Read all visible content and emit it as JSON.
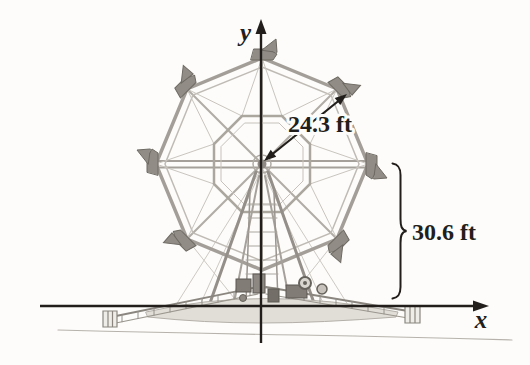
{
  "figure": {
    "axes": {
      "x_label": "x",
      "y_label": "y"
    },
    "annotations": {
      "radius_label": "24.3 ft",
      "height_label": "30.6 ft"
    },
    "values": {
      "wheel_radius_ft": 24.3,
      "hub_height_ft": 30.6
    },
    "colors": {
      "background": "#fdfcfa",
      "ink": "#211e1b",
      "sketch_light": "#c7c3bc",
      "sketch_mid": "#a5a19a",
      "sketch_dark": "#736f68"
    }
  }
}
